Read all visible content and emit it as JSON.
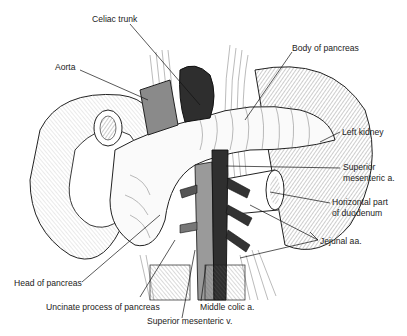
{
  "figure": {
    "labels": [
      {
        "id": "celiac",
        "text": "Celiac trunk"
      },
      {
        "id": "body",
        "text": "Body of pancreas"
      },
      {
        "id": "aorta",
        "text": "Aorta"
      },
      {
        "id": "kidney",
        "text": "Left kidney"
      },
      {
        "id": "sma_1",
        "text": "Superior"
      },
      {
        "id": "sma_2",
        "text": "mesenteric a."
      },
      {
        "id": "duod_1",
        "text": "Horizontal part"
      },
      {
        "id": "duod_2",
        "text": "of duodenum"
      },
      {
        "id": "jejunal",
        "text": "Jejunal aa."
      },
      {
        "id": "head",
        "text": "Head of pancreas"
      },
      {
        "id": "uncinate",
        "text": "Uncinate process of pancreas"
      },
      {
        "id": "midcolic",
        "text": "Middle colic a."
      },
      {
        "id": "smv",
        "text": "Superior mesenteric v."
      }
    ]
  }
}
